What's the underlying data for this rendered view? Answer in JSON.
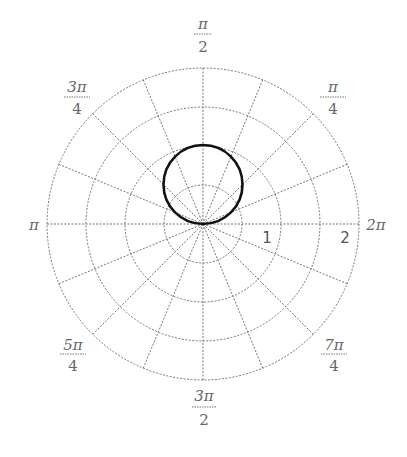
{
  "chart_data": {
    "type": "polar",
    "title": "",
    "curve": {
      "equation": "r = 2 sin(theta)",
      "shape": "circle",
      "diameter": 2,
      "center": [
        0,
        1
      ]
    },
    "radial_rings": [
      0.5,
      1,
      1.5,
      2
    ],
    "radial_tick_labels": [
      "1",
      "2"
    ],
    "angular_divisions": 16,
    "angle_labels": [
      {
        "id": "a0",
        "num": "2π",
        "den": "",
        "angle_deg": 0
      },
      {
        "id": "a45",
        "num": "π",
        "den": "4",
        "angle_deg": 45
      },
      {
        "id": "a90",
        "num": "π",
        "den": "2",
        "angle_deg": 90
      },
      {
        "id": "a135",
        "num": "3π",
        "den": "4",
        "angle_deg": 135
      },
      {
        "id": "a180",
        "num": "π",
        "den": "",
        "angle_deg": 180
      },
      {
        "id": "a225",
        "num": "5π",
        "den": "4",
        "angle_deg": 225
      },
      {
        "id": "a270",
        "num": "3π",
        "den": "2",
        "angle_deg": 270
      },
      {
        "id": "a315",
        "num": "7π",
        "den": "4",
        "angle_deg": 315
      }
    ],
    "grid": true
  },
  "labels": {
    "pi_over_2": {
      "num": "π",
      "den": "2"
    },
    "pi_over_4": {
      "num": "π",
      "den": "4"
    },
    "three_pi_over_4": {
      "num": "3π",
      "den": "4"
    },
    "pi": "π",
    "two_pi": "2π",
    "five_pi_over_4": {
      "num": "5π",
      "den": "4"
    },
    "seven_pi_over_4": {
      "num": "7π",
      "den": "4"
    },
    "three_pi_over_2": {
      "num": "3π",
      "den": "2"
    },
    "r1": "1",
    "r2": "2"
  }
}
